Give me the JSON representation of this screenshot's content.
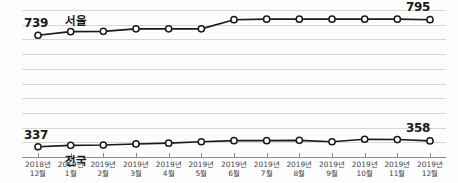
{
  "chart_data": {
    "type": "line",
    "title": "",
    "subtitle": "",
    "xlabel": "",
    "ylabel": "",
    "grid": true,
    "legend_position": "inline",
    "categories": [
      "2018년 12월",
      "2019년 1월",
      "2019년 2월",
      "2019년 3월",
      "2019년 4월",
      "2019년 5월",
      "2019년 6월",
      "2019년 7월",
      "2019년 8월",
      "2019년 9월",
      "2019년 10월",
      "2019년 11월",
      "2019년 12월"
    ],
    "category_lines": [
      [
        "2018년",
        "12월"
      ],
      [
        "2019년",
        "1월"
      ],
      [
        "2019년",
        "2월"
      ],
      [
        "2019년",
        "3월"
      ],
      [
        "2019년",
        "4월"
      ],
      [
        "2019년",
        "5월"
      ],
      [
        "2019년",
        "6월"
      ],
      [
        "2019년",
        "7월"
      ],
      [
        "2019년",
        "8월"
      ],
      [
        "2019년",
        "9월"
      ],
      [
        "2019년",
        "10월"
      ],
      [
        "2019년",
        "11월"
      ],
      [
        "2019년",
        "12월"
      ]
    ],
    "ylim": [
      300,
      830
    ],
    "series": [
      {
        "name": "서울",
        "color": "#1a1a1a",
        "values": [
          739,
          752,
          753,
          762,
          762,
          762,
          795,
          797,
          797,
          797,
          797,
          797,
          795
        ],
        "start_label": "739",
        "end_label": "795"
      },
      {
        "name": "전국",
        "color": "#1a1a1a",
        "values": [
          337,
          342,
          343,
          347,
          350,
          355,
          359,
          359,
          360,
          355,
          364,
          363,
          358
        ],
        "start_label": "337",
        "end_label": "358"
      }
    ]
  },
  "labels": {
    "seoul_series_name": "서울",
    "national_series_name": "전국",
    "seoul_start_value": "739",
    "seoul_end_value": "795",
    "national_start_value": "337",
    "national_end_value": "358"
  }
}
